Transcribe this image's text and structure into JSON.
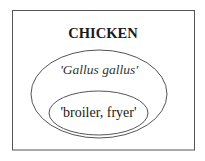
{
  "diagram": {
    "title": "CHICKEN",
    "outer_set": {
      "label": "'Gallus gallus'"
    },
    "inner_set": {
      "label": "'broiler, fryer'"
    },
    "colors": {
      "stroke": "#555555",
      "background": "#ffffff",
      "text": "#1a1a1a"
    }
  }
}
